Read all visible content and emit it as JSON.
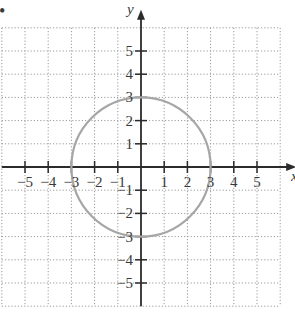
{
  "chart_data": {
    "type": "line",
    "title": "",
    "xlabel": "x",
    "ylabel": "y",
    "xlim": [
      -6,
      6
    ],
    "ylim": [
      -6,
      6
    ],
    "grid": true,
    "grid_style": "dotted",
    "x_ticks": [
      -5,
      -4,
      -3,
      -2,
      -1,
      1,
      2,
      3,
      4,
      5
    ],
    "y_ticks": [
      -5,
      -4,
      -3,
      -2,
      -1,
      1,
      2,
      3,
      4,
      5
    ],
    "x_tick_labels": [
      "−5",
      "−4",
      "−3",
      "−2",
      "−1",
      "1",
      "2",
      "3",
      "4",
      "5"
    ],
    "y_tick_labels": [
      "−5",
      "−4",
      "−3",
      "−2",
      "−1",
      "1",
      "2",
      "3",
      "4",
      "5"
    ],
    "series": [
      {
        "name": "circle x^2 + y^2 = 9",
        "shape": "circle",
        "center": [
          0,
          0
        ],
        "radius": 3,
        "color": "#a6a6a6",
        "points": [
          [
            3,
            0
          ],
          [
            0,
            3
          ],
          [
            -3,
            0
          ],
          [
            0,
            -3
          ]
        ]
      }
    ],
    "legend": null
  },
  "colors": {
    "axis": "#2b2b2b",
    "grid": "#9a9a9a",
    "curve": "#a6a6a6",
    "text": "#3a3a3a"
  },
  "labels": {
    "x_axis": "x",
    "y_axis": "y",
    "bullet": "•"
  }
}
